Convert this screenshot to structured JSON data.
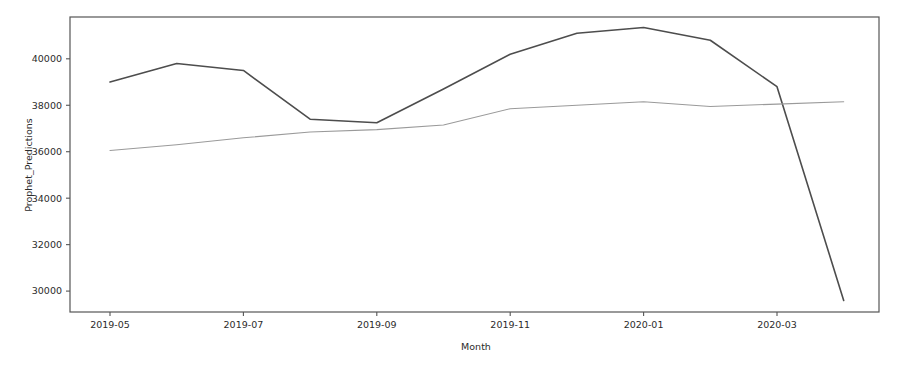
{
  "chart_data": {
    "type": "line",
    "title": "",
    "xlabel": "Month",
    "ylabel": "Prophet_Predictions",
    "grid": false,
    "legend": "none",
    "x": [
      "2019-05",
      "2019-06",
      "2019-07",
      "2019-08",
      "2019-09",
      "2019-10",
      "2019-11",
      "2019-12",
      "2020-01",
      "2020-02",
      "2020-03",
      "2020-04"
    ],
    "xlim": [
      "2019-04-15",
      "2020-04-15"
    ],
    "ylim": [
      29100,
      41800
    ],
    "xticks": [
      "2019-05",
      "2019-07",
      "2019-09",
      "2019-11",
      "2020-01",
      "2020-03"
    ],
    "yticks": [
      30000,
      32000,
      34000,
      36000,
      38000,
      40000
    ],
    "ytick_labels": [
      "30000",
      "32000",
      "34000",
      "36000",
      "38000",
      "40000"
    ],
    "series": [
      {
        "name": "actual",
        "color": "#4d4d4d",
        "linewidth": 1.6,
        "values": [
          39000,
          39800,
          39500,
          37400,
          37250,
          38700,
          40200,
          41100,
          41350,
          40800,
          38800,
          29600
        ]
      },
      {
        "name": "prophet_forecast",
        "color": "#9a9a9a",
        "linewidth": 1.1,
        "values": [
          36050,
          36300,
          36600,
          36850,
          36950,
          37150,
          37850,
          38000,
          38150,
          37950,
          38050,
          38150
        ]
      }
    ]
  },
  "axes": {
    "ylabel_text": "Prophet_Predictions",
    "xlabel_text": "Month"
  }
}
